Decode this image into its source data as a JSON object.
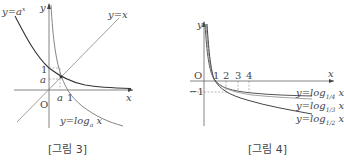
{
  "figures": [
    {
      "caption": "[그림 3]",
      "labels": {
        "exp_curve": "y=a",
        "exp_sup": "x",
        "y_axis": "y",
        "x_axis": "x",
        "identity": "y=x",
        "origin": "O",
        "y_tick_1": "1",
        "y_tick_a": "a",
        "x_tick_a": "a",
        "x_tick_1": "1",
        "log_curve": "y=log",
        "log_base": "a",
        "log_arg": " x"
      },
      "colors": {
        "exp_curve": "#333333",
        "log_curve": "#777777",
        "identity": "#888888",
        "axes": "#666666"
      }
    },
    {
      "caption": "[그림 4]",
      "labels": {
        "y_axis": "y",
        "x_axis": "x",
        "origin": "O",
        "x_ticks": [
          "1",
          "2",
          "3",
          "4"
        ],
        "y_tick_neg1": "−1",
        "curves": [
          {
            "prefix": "y=log",
            "base": "1/4",
            "arg": " x"
          },
          {
            "prefix": "y=log",
            "base": "1/3",
            "arg": " x"
          },
          {
            "prefix": "y=log",
            "base": "1/2",
            "arg": " x"
          }
        ]
      },
      "colors": {
        "curve_quarter": "#555555",
        "curve_third": "#888888",
        "curve_half": "#444444",
        "axes": "#666666"
      }
    }
  ]
}
